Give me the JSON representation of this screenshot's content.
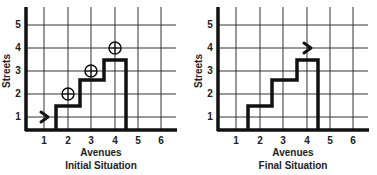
{
  "panels": [
    {
      "title": "Initial Situation",
      "x_label": "Avenues",
      "y_label": "Streets",
      "x_ticks": [
        "1",
        "2",
        "3",
        "4",
        "5",
        "6"
      ],
      "y_ticks": [
        "1",
        "2",
        "3",
        "4",
        "5"
      ],
      "robot": {
        "avenue": 1,
        "street": 1,
        "facing": "east"
      },
      "beepers": [
        {
          "avenue": 2,
          "street": 2
        },
        {
          "avenue": 3,
          "street": 3
        },
        {
          "avenue": 4,
          "street": 4
        }
      ]
    },
    {
      "title": "Final Situation",
      "x_label": "Avenues",
      "y_label": "Streets",
      "x_ticks": [
        "1",
        "2",
        "3",
        "4",
        "5",
        "6"
      ],
      "y_ticks": [
        "1",
        "2",
        "3",
        "4",
        "5"
      ],
      "robot": {
        "avenue": 4,
        "street": 4,
        "facing": "east"
      },
      "beepers": []
    }
  ],
  "colors": {
    "ink": "#1a1a1a",
    "grid": "#333333",
    "background": "#ffffff"
  }
}
